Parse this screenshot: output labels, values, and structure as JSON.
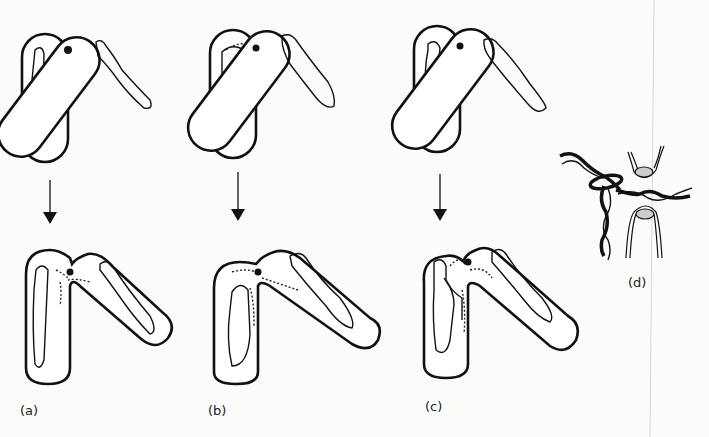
{
  "figure": {
    "type": "scientific-diagram",
    "panels": [
      {
        "id": "a",
        "label": "(a)"
      },
      {
        "id": "b",
        "label": "(b)"
      },
      {
        "id": "c",
        "label": "(c)"
      },
      {
        "id": "d",
        "label": "(d)"
      }
    ],
    "colors": {
      "ink": "#111111",
      "paper": "#fbfbf9"
    }
  }
}
